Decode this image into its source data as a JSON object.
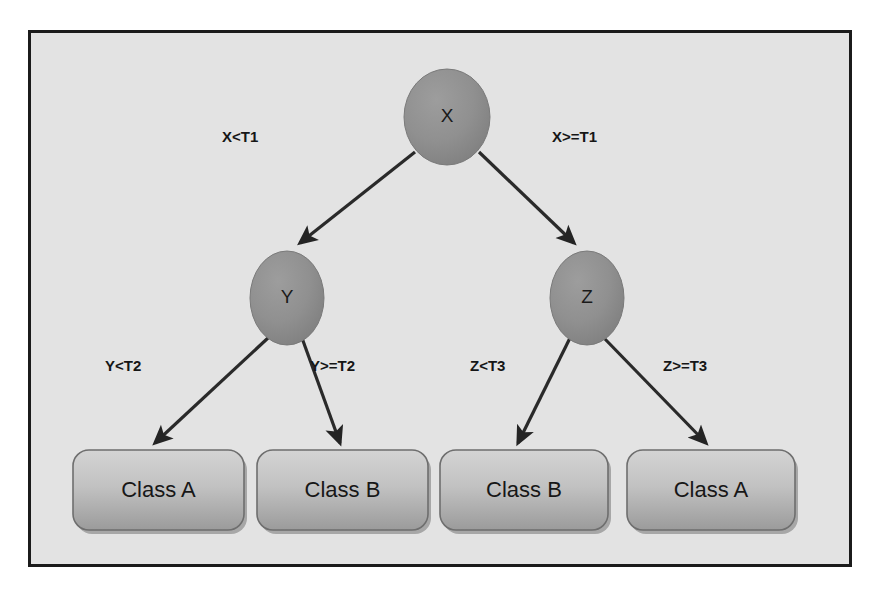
{
  "diagram": {
    "background_color": "#e3e3e3",
    "border_color": "#1b1b1b",
    "node_fill_color": "#8f8f8f",
    "leaf_fill_top_color": "#cfcfcf",
    "leaf_fill_bottom_color": "#9a9a9a",
    "edge_color": "#2a2a2a"
  },
  "nodes": {
    "root": {
      "label": "X",
      "cx": 447,
      "cy": 117,
      "rx": 43,
      "ry": 48
    },
    "left": {
      "label": "Y",
      "cx": 287,
      "cy": 298,
      "rx": 37,
      "ry": 47
    },
    "right": {
      "label": "Z",
      "cx": 587,
      "cy": 298,
      "rx": 37,
      "ry": 47
    }
  },
  "leaves": [
    {
      "label": "Class A",
      "x": 73,
      "y": 450,
      "w": 171,
      "h": 80
    },
    {
      "label": "Class B",
      "x": 257,
      "y": 450,
      "w": 171,
      "h": 80
    },
    {
      "label": "Class B",
      "x": 440,
      "y": 450,
      "w": 168,
      "h": 80
    },
    {
      "label": "Class A",
      "x": 627,
      "y": 450,
      "w": 168,
      "h": 80
    }
  ],
  "edge_labels": {
    "root_left": "X<T1",
    "root_right": "X>=T1",
    "y_left": "Y<T2",
    "y_right": "Y>=T2",
    "z_left": "Z<T3",
    "z_right": "Z>=T3"
  },
  "edge_label_positions": {
    "root_left": {
      "x": 222,
      "y": 128
    },
    "root_right": {
      "x": 552,
      "y": 128
    },
    "y_left": {
      "x": 105,
      "y": 357
    },
    "y_right": {
      "x": 310,
      "y": 357
    },
    "z_left": {
      "x": 470,
      "y": 357
    },
    "z_right": {
      "x": 663,
      "y": 357
    }
  }
}
